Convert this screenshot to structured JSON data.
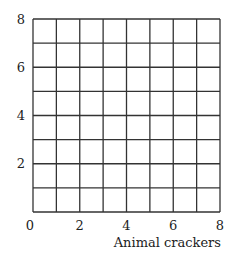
{
  "chart_data": {
    "type": "scatter",
    "title": "",
    "xlabel": "Animal crackers",
    "ylabel": "",
    "xlim": [
      0,
      8
    ],
    "ylim": [
      0,
      8
    ],
    "x_ticks": [
      0,
      2,
      4,
      6,
      8
    ],
    "y_ticks": [
      2,
      4,
      6,
      8
    ],
    "grid": true,
    "grid_step": 1,
    "series": [],
    "note": "Empty grid — no data points plotted"
  }
}
